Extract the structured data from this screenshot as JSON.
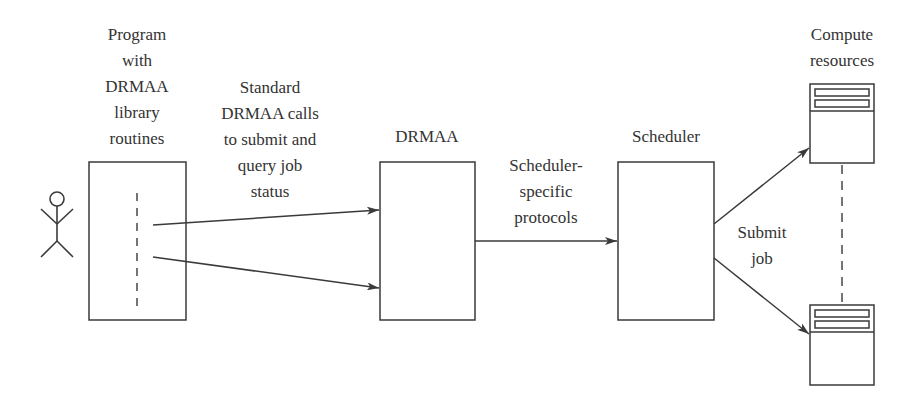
{
  "diagram": {
    "colors": {
      "stroke": "#3a3a3a",
      "text": "#333333",
      "background": "#ffffff"
    },
    "nodes": {
      "user": {
        "icon": "stick-figure-icon"
      },
      "program": {
        "label_lines": [
          "Program",
          "with",
          "DRMAA",
          "library",
          "routines"
        ]
      },
      "drmaa": {
        "label": "DRMAA"
      },
      "scheduler": {
        "label": "Scheduler"
      },
      "compute": {
        "label_lines": [
          "Compute",
          "resources"
        ],
        "icon": "server-icon"
      }
    },
    "edges": {
      "program_to_drmaa": {
        "label_lines": [
          "Standard",
          "DRMAA calls",
          "to submit and",
          "query job",
          "status"
        ]
      },
      "drmaa_to_scheduler": {
        "label_lines": [
          "Scheduler-",
          "specific",
          "protocols"
        ]
      },
      "scheduler_to_compute": {
        "label_lines": [
          "Submit",
          "job"
        ]
      }
    }
  }
}
